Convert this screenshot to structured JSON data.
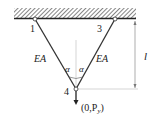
{
  "diagram": {
    "type": "two-bar truss",
    "support": "fixed ceiling (hatched)",
    "nodes": [
      {
        "id": "1",
        "label": "1"
      },
      {
        "id": "3",
        "label": "3"
      },
      {
        "id": "4",
        "label": "4"
      }
    ],
    "members": [
      {
        "from": "1",
        "to": "4",
        "label": "EA"
      },
      {
        "from": "3",
        "to": "4",
        "label": "EA"
      }
    ],
    "angles": {
      "left": "α",
      "right": "α"
    },
    "dimension": {
      "label": "l"
    },
    "load": {
      "label": "(0,P",
      "sub": "y",
      "close": ")"
    },
    "colors": {
      "line": "#333333",
      "dim": "#888888",
      "hatch": "#333333"
    }
  }
}
